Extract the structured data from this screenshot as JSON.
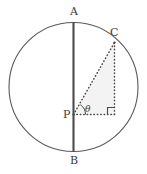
{
  "figure": {
    "background_color": "#ffffff",
    "stroke_color": "#595959",
    "diameter_color": "#4a4a4a",
    "dotted_color": "#5a5a5a",
    "triangle_fill": "#f3f3f3",
    "labels": {
      "top": "A",
      "bottom": "B",
      "circle_point": "C",
      "center": "P",
      "angle": "θ"
    },
    "geometry": {
      "circle": {
        "cx": 73.5,
        "cy": 87,
        "r": 64.5
      },
      "point_A": {
        "x": 73.5,
        "y": 22.5
      },
      "point_B": {
        "x": 73.5,
        "y": 151.5
      },
      "point_P": {
        "x": 73.5,
        "y": 114.5
      },
      "point_C": {
        "x": 114.5,
        "y": 42.5
      },
      "point_foot": {
        "x": 114.5,
        "y": 114.5
      },
      "right_angle_marker_size": 7,
      "angle_arc_radius": 12
    }
  }
}
